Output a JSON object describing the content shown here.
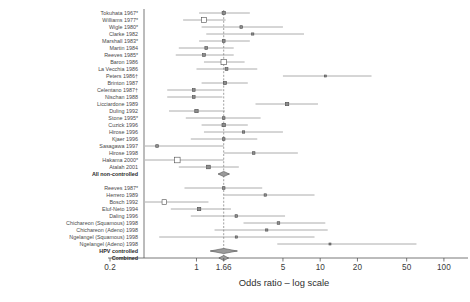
{
  "chart_data": {
    "type": "forest",
    "title": "",
    "xlabel": "Odds ratio – log scale",
    "ylabel": "",
    "xscale": "log",
    "xlim": [
      0.2,
      130
    ],
    "xticks": [
      0.2,
      1,
      1.66,
      5,
      10,
      20,
      50,
      100
    ],
    "xticklabels": [
      "0.2",
      "1",
      "1.66",
      "5",
      "10",
      "20",
      "50",
      "100"
    ],
    "reference_line": 1.66,
    "grid": false,
    "legend": "none",
    "groups": [
      {
        "name": "non-controlled",
        "rows": [
          {
            "label": "Tokuhata 1967*",
            "or": 1.66,
            "lo": 1.05,
            "hi": 2.7,
            "marker": "square",
            "size": 3.2
          },
          {
            "label": "Williams 1977*",
            "or": 1.15,
            "lo": 0.78,
            "hi": 1.72,
            "marker": "square",
            "size": 5.0
          },
          {
            "label": "Wigle 1980*",
            "or": 2.3,
            "lo": 1.1,
            "hi": 5.0,
            "marker": "square",
            "size": 2.6
          },
          {
            "label": "Clarke 1982",
            "or": 2.85,
            "lo": 1.2,
            "hi": 7.4,
            "marker": "square",
            "size": 2.2
          },
          {
            "label": "Marshall 1983*",
            "or": 1.66,
            "lo": 1.05,
            "hi": 2.7,
            "marker": "square",
            "size": 2.8
          },
          {
            "label": "Martin 1984",
            "or": 1.2,
            "lo": 0.72,
            "hi": 2.0,
            "marker": "square",
            "size": 2.8
          },
          {
            "label": "Reeves 1985*",
            "or": 1.15,
            "lo": 0.68,
            "hi": 2.0,
            "marker": "square",
            "size": 2.8
          },
          {
            "label": "Baron 1986",
            "or": 1.66,
            "lo": 1.15,
            "hi": 2.45,
            "marker": "square",
            "size": 5.4
          },
          {
            "label": "La Vecchia 1986",
            "or": 1.75,
            "lo": 1.0,
            "hi": 3.1,
            "marker": "square",
            "size": 2.8
          },
          {
            "label": "Peters 1986†",
            "or": 11.0,
            "lo": 5.0,
            "hi": 26.0,
            "marker": "square",
            "size": 2.0
          },
          {
            "label": "Brinton 1987",
            "or": 1.7,
            "lo": 1.1,
            "hi": 2.6,
            "marker": "square",
            "size": 3.2
          },
          {
            "label": "Celentano 1987†",
            "or": 0.95,
            "lo": 0.58,
            "hi": 1.62,
            "marker": "square",
            "size": 2.8
          },
          {
            "label": "Nischan 1988",
            "or": 0.95,
            "lo": 0.58,
            "hi": 1.62,
            "marker": "square",
            "size": 2.8
          },
          {
            "label": "Licciardone 1989",
            "or": 5.4,
            "lo": 3.0,
            "hi": 9.6,
            "marker": "square",
            "size": 3.4
          },
          {
            "label": "Duling 1992",
            "or": 1.0,
            "lo": 0.6,
            "hi": 1.7,
            "marker": "square",
            "size": 3.4
          },
          {
            "label": "Stone 1995*",
            "or": 1.66,
            "lo": 0.82,
            "hi": 3.3,
            "marker": "square",
            "size": 2.6
          },
          {
            "label": "Cuzick 1996",
            "or": 1.66,
            "lo": 1.1,
            "hi": 2.6,
            "marker": "square",
            "size": 3.4
          },
          {
            "label": "Hirose 1996",
            "or": 2.4,
            "lo": 1.15,
            "hi": 5.0,
            "marker": "square",
            "size": 2.4
          },
          {
            "label": "Kjaer 1996",
            "or": 1.66,
            "lo": 0.9,
            "hi": 3.1,
            "marker": "square",
            "size": 2.6
          },
          {
            "label": "Sasagawa 1997",
            "or": 0.48,
            "lo": 0.24,
            "hi": 1.66,
            "marker": "square",
            "size": 2.6
          },
          {
            "label": "Hirose 1998",
            "or": 2.9,
            "lo": 1.66,
            "hi": 6.6,
            "marker": "square",
            "size": 2.6
          },
          {
            "label": "Hakama 2000*",
            "or": 0.7,
            "lo": 0.3,
            "hi": 1.66,
            "marker": "square",
            "size": 5.6
          },
          {
            "label": "Atalah 2001",
            "or": 1.25,
            "lo": 0.72,
            "hi": 2.2,
            "marker": "square",
            "size": 3.6
          }
        ],
        "summary": {
          "label": "All non-controlled",
          "or": 1.66,
          "lo": 1.5,
          "hi": 1.85,
          "marker": "diamond"
        }
      },
      {
        "name": "HPV-controlled",
        "rows": [
          {
            "label": "Reeves 1987*",
            "or": 1.66,
            "lo": 0.8,
            "hi": 3.4,
            "marker": "square",
            "size": 2.6
          },
          {
            "label": "Herrero 1989",
            "or": 3.6,
            "lo": 1.66,
            "hi": 9.0,
            "marker": "square",
            "size": 2.4
          },
          {
            "label": "Bosch 1992",
            "or": 0.55,
            "lo": 0.25,
            "hi": 1.25,
            "marker": "square",
            "size": 4.6
          },
          {
            "label": "Eluf-Neto 1994",
            "or": 1.05,
            "lo": 0.62,
            "hi": 1.9,
            "marker": "square",
            "size": 3.4
          },
          {
            "label": "Daling 1996",
            "or": 2.1,
            "lo": 0.9,
            "hi": 5.2,
            "marker": "square",
            "size": 2.6
          },
          {
            "label": "Chichareon (Squamous) 1998",
            "or": 4.6,
            "lo": 2.4,
            "hi": 11.0,
            "marker": "square",
            "size": 2.6
          },
          {
            "label": "Chichareon (Adeno) 1998",
            "or": 3.7,
            "lo": 1.4,
            "hi": 11.5,
            "marker": "square",
            "size": 2.2
          },
          {
            "label": "Ngelangel (Squamous) 1998",
            "or": 2.1,
            "lo": 0.5,
            "hi": 9.0,
            "marker": "square",
            "size": 2.2
          },
          {
            "label": "Ngelangel (Adeno) 1998",
            "or": 12.0,
            "lo": 4.5,
            "hi": 60.0,
            "marker": "square",
            "size": 2.0
          }
        ],
        "summary": {
          "label": "HPV controlled",
          "or": 1.66,
          "lo": 1.3,
          "hi": 2.15,
          "marker": "diamond"
        }
      }
    ],
    "overall": {
      "label": "Combined",
      "or": 1.66,
      "lo": 1.52,
      "hi": 1.82,
      "marker": "diamond"
    }
  }
}
